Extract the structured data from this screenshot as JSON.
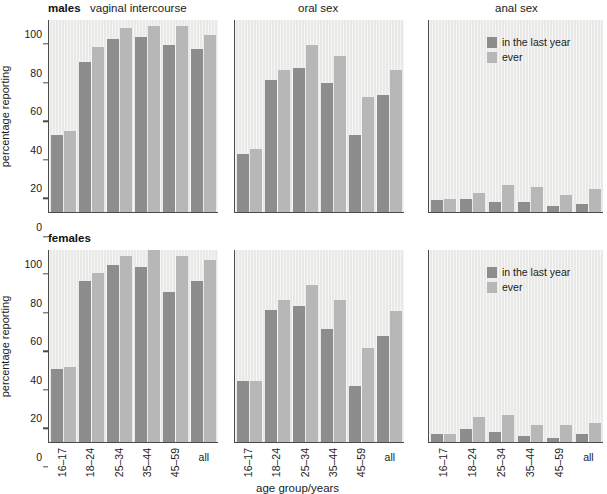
{
  "figure": {
    "ylabel": "percentage reporting",
    "xlabel": "age group/years",
    "categories": [
      "16–17",
      "18–24",
      "25–34",
      "35–44",
      "45–59",
      "all"
    ],
    "yticks": [
      "0",
      "20",
      "40",
      "60",
      "80",
      "100"
    ],
    "ylim": [
      0,
      100
    ],
    "legend": {
      "items": [
        {
          "label": "in the last year",
          "color": "#8d8d8d"
        },
        {
          "label": "ever",
          "color": "#b7b7b7"
        }
      ]
    },
    "colors": {
      "last_year": "#8d8d8d",
      "ever": "#b7b7b7",
      "plot_background": "#e9e9e7",
      "axis": "#4a4a4a"
    },
    "rows": [
      {
        "key": "males",
        "label": "males"
      },
      {
        "key": "females",
        "label": "females"
      }
    ],
    "panels": [
      {
        "key": "vaginal",
        "title": "vaginal intercourse"
      },
      {
        "key": "oral",
        "title": "oral sex"
      },
      {
        "key": "anal",
        "title": "anal sex"
      }
    ]
  },
  "chart_data": [
    {
      "type": "bar",
      "title": "vaginal intercourse",
      "group": "males",
      "xlabel": "age group/years",
      "ylabel": "percentage reporting",
      "ylim": [
        0,
        100
      ],
      "grid": false,
      "legend_position": "none",
      "categories": [
        "16–17",
        "18–24",
        "25–34",
        "35–44",
        "45–59",
        "all"
      ],
      "series": [
        {
          "name": "in the last year",
          "values": [
            40,
            78,
            90,
            91,
            87,
            85
          ]
        },
        {
          "name": "ever",
          "values": [
            42,
            86,
            96,
            97,
            97,
            92
          ]
        }
      ]
    },
    {
      "type": "bar",
      "title": "oral sex",
      "group": "males",
      "xlabel": "age group/years",
      "ylabel": "percentage reporting",
      "ylim": [
        0,
        100
      ],
      "grid": false,
      "legend_position": "none",
      "categories": [
        "16–17",
        "18–24",
        "25–34",
        "35–44",
        "45–59",
        "all"
      ],
      "series": [
        {
          "name": "in the last year",
          "values": [
            30,
            69,
            75,
            67,
            40,
            61
          ]
        },
        {
          "name": "ever",
          "values": [
            33,
            74,
            87,
            81,
            60,
            74
          ]
        }
      ]
    },
    {
      "type": "bar",
      "title": "anal sex",
      "group": "males",
      "xlabel": "age group/years",
      "ylabel": "percentage reporting",
      "ylim": [
        0,
        100
      ],
      "grid": false,
      "legend_position": "top-right",
      "categories": [
        "16–17",
        "18–24",
        "25–34",
        "35–44",
        "45–59",
        "all"
      ],
      "series": [
        {
          "name": "in the last year",
          "values": [
            6,
            7,
            5,
            5,
            3,
            4
          ]
        },
        {
          "name": "ever",
          "values": [
            7,
            10,
            14,
            13,
            9,
            12
          ]
        }
      ]
    },
    {
      "type": "bar",
      "title": "vaginal intercourse",
      "group": "females",
      "xlabel": "age group/years",
      "ylabel": "percentage reporting",
      "ylim": [
        0,
        100
      ],
      "grid": false,
      "legend_position": "none",
      "categories": [
        "16–17",
        "18–24",
        "25–34",
        "35–44",
        "45–59",
        "all"
      ],
      "series": [
        {
          "name": "in the last year",
          "values": [
            38,
            84,
            92,
            91,
            78,
            84
          ]
        },
        {
          "name": "ever",
          "values": [
            39,
            88,
            97,
            100,
            97,
            95
          ]
        }
      ]
    },
    {
      "type": "bar",
      "title": "oral sex",
      "group": "females",
      "xlabel": "age group/years",
      "ylabel": "percentage reporting",
      "ylim": [
        0,
        100
      ],
      "grid": false,
      "legend_position": "none",
      "categories": [
        "16–17",
        "18–24",
        "25–34",
        "35–44",
        "45–59",
        "all"
      ],
      "series": [
        {
          "name": "in the last year",
          "values": [
            32,
            69,
            71,
            59,
            29,
            55
          ]
        },
        {
          "name": "ever",
          "values": [
            32,
            74,
            82,
            74,
            49,
            68
          ]
        }
      ]
    },
    {
      "type": "bar",
      "title": "anal sex",
      "group": "females",
      "xlabel": "age group/years",
      "ylabel": "percentage reporting",
      "ylim": [
        0,
        100
      ],
      "grid": false,
      "legend_position": "top-right",
      "categories": [
        "16–17",
        "18–24",
        "25–34",
        "35–44",
        "45–59",
        "all"
      ],
      "series": [
        {
          "name": "in the last year",
          "values": [
            4,
            7,
            5,
            3,
            2,
            4
          ]
        },
        {
          "name": "ever",
          "values": [
            4,
            13,
            14,
            9,
            9,
            10
          ]
        }
      ]
    }
  ]
}
